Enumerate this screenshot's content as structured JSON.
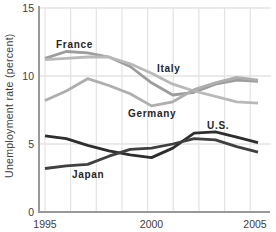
{
  "chart_data": {
    "type": "line",
    "title": "",
    "xlabel": "",
    "ylabel": "Unemployment rate (percent)",
    "x": [
      1995,
      1996,
      1997,
      1998,
      1999,
      2000,
      2001,
      2002,
      2003,
      2004,
      2005
    ],
    "xlim": [
      1995,
      2005
    ],
    "ylim": [
      0,
      15
    ],
    "xticks": [
      "1995",
      "2000",
      "2005"
    ],
    "xtick_years": [
      1995,
      2000,
      2005
    ],
    "yticks": [
      "0",
      "5",
      "10",
      "15"
    ],
    "ytick_values": [
      0,
      5,
      10,
      15
    ],
    "grid": true,
    "legend_position": "inline-labels",
    "series": [
      {
        "name": "France",
        "color": "#9d9d9d",
        "values": [
          11.3,
          11.8,
          11.7,
          11.4,
          10.7,
          9.5,
          8.6,
          8.8,
          9.4,
          9.7,
          9.6
        ]
      },
      {
        "name": "Italy",
        "color": "#b9b9b9",
        "values": [
          11.2,
          11.3,
          11.4,
          11.4,
          10.9,
          10.2,
          9.4,
          8.9,
          8.5,
          8.1,
          8.0
        ]
      },
      {
        "name": "Germany",
        "color": "#aeaeae",
        "values": [
          8.2,
          8.9,
          9.8,
          9.3,
          8.7,
          7.8,
          8.1,
          9.0,
          9.5,
          9.9,
          9.7
        ]
      },
      {
        "name": "U.S.",
        "color": "#2e2e2e",
        "values": [
          5.6,
          5.4,
          4.9,
          4.5,
          4.2,
          4.0,
          4.7,
          5.8,
          5.9,
          5.5,
          5.1
        ]
      },
      {
        "name": "Japan",
        "color": "#404040",
        "values": [
          3.2,
          3.4,
          3.5,
          4.1,
          4.6,
          4.7,
          5.0,
          5.4,
          5.3,
          4.8,
          4.4
        ]
      }
    ]
  },
  "colors": {
    "background": "#ffffff",
    "grid": "#e3e3e3",
    "axis": "#999999",
    "label_text": "#262626",
    "tick_text": "#3d3d3d"
  }
}
